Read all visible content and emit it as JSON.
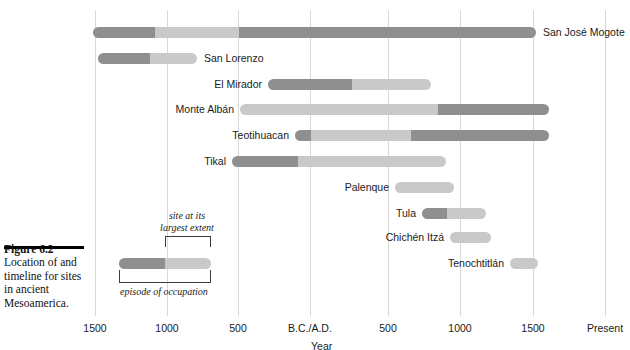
{
  "figure": {
    "title": "Figure 6.2",
    "caption": "Location of and timeline for sites in ancient Mesoamerica."
  },
  "colors": {
    "occupation": "#8f8f8f",
    "largest_extent": "#c9c9c9",
    "gridline": "#d9d9d9",
    "text": "#1a1a1a"
  },
  "axis": {
    "title": "Year",
    "ticks": [
      {
        "label": "1500",
        "x": 95
      },
      {
        "label": "1000",
        "x": 167
      },
      {
        "label": "500",
        "x": 238
      },
      {
        "label": "B.C./A.D.",
        "x": 310
      },
      {
        "label": "500",
        "x": 388
      },
      {
        "label": "1000",
        "x": 460
      },
      {
        "label": "1500",
        "x": 533
      },
      {
        "label": "Present",
        "x": 605
      }
    ]
  },
  "legend": {
    "top_label_line1": "site at its",
    "top_label_line2": "largest extent",
    "bottom_label": "episode of occupation"
  },
  "chart_data": {
    "type": "bar",
    "title": "Figure 6.2",
    "xlabel": "Year",
    "ylabel": "",
    "legend_position": "inline-left",
    "grid": true,
    "orientation": "horizontal-timeline",
    "axis_ticks": [
      "1500 B.C.",
      "1000 B.C.",
      "500 B.C.",
      "B.C./A.D.",
      "A.D. 500",
      "A.D. 1000",
      "A.D. 1500",
      "Present"
    ],
    "series": [
      {
        "name": "episode of occupation",
        "color": "#8f8f8f"
      },
      {
        "name": "site at its largest extent",
        "color": "#c9c9c9"
      }
    ],
    "categories": [
      "San José Mogote",
      "San Lorenzo",
      "El Mirador",
      "Monte Albán",
      "Teotihuacan",
      "Tikal",
      "Palenque",
      "Tula",
      "Chichén Itzá",
      "Tenochtitlán"
    ],
    "bars": [
      {
        "label": "San José Mogote",
        "label_side": "right",
        "row_y": 27,
        "x_start": 93,
        "x_end": 536,
        "segments": [
          {
            "type": "occupation",
            "x_start": 93,
            "x_end": 155
          },
          {
            "type": "largest_extent",
            "x_start": 155,
            "x_end": 239
          },
          {
            "type": "occupation",
            "x_start": 239,
            "x_end": 536
          }
        ]
      },
      {
        "label": "San Lorenzo",
        "label_side": "right",
        "row_y": 53,
        "x_start": 98,
        "x_end": 197,
        "segments": [
          {
            "type": "occupation",
            "x_start": 98,
            "x_end": 150
          },
          {
            "type": "largest_extent",
            "x_start": 150,
            "x_end": 197
          }
        ]
      },
      {
        "label": "El Mirador",
        "label_side": "left",
        "row_y": 79,
        "x_start": 268,
        "x_end": 431,
        "segments": [
          {
            "type": "occupation",
            "x_start": 268,
            "x_end": 352
          },
          {
            "type": "largest_extent",
            "x_start": 352,
            "x_end": 431
          }
        ]
      },
      {
        "label": "Monte Albán",
        "label_side": "left",
        "row_y": 104,
        "x_start": 240,
        "x_end": 549,
        "segments": [
          {
            "type": "largest_extent",
            "x_start": 240,
            "x_end": 438
          },
          {
            "type": "occupation",
            "x_start": 438,
            "x_end": 549
          }
        ]
      },
      {
        "label": "Teotihuacan",
        "label_side": "left",
        "row_y": 130,
        "x_start": 295,
        "x_end": 549,
        "segments": [
          {
            "type": "occupation",
            "x_start": 295,
            "x_end": 311
          },
          {
            "type": "largest_extent",
            "x_start": 311,
            "x_end": 411
          },
          {
            "type": "occupation",
            "x_start": 411,
            "x_end": 549
          }
        ]
      },
      {
        "label": "Tikal",
        "label_side": "left",
        "row_y": 156,
        "x_start": 232,
        "x_end": 446,
        "segments": [
          {
            "type": "occupation",
            "x_start": 232,
            "x_end": 298
          },
          {
            "type": "largest_extent",
            "x_start": 298,
            "x_end": 446
          }
        ]
      },
      {
        "label": "Palenque",
        "label_side": "left",
        "row_y": 182,
        "x_start": 395,
        "x_end": 454,
        "segments": [
          {
            "type": "largest_extent",
            "x_start": 395,
            "x_end": 454
          }
        ]
      },
      {
        "label": "Tula",
        "label_side": "left",
        "row_y": 208,
        "x_start": 422,
        "x_end": 486,
        "segments": [
          {
            "type": "occupation",
            "x_start": 422,
            "x_end": 447
          },
          {
            "type": "largest_extent",
            "x_start": 447,
            "x_end": 486
          }
        ]
      },
      {
        "label": "Chichén Itzá",
        "label_side": "left",
        "row_y": 232,
        "x_start": 450,
        "x_end": 491,
        "segments": [
          {
            "type": "largest_extent",
            "x_start": 450,
            "x_end": 491
          }
        ]
      },
      {
        "label": "Tenochtitlán",
        "label_side": "left",
        "row_y": 258,
        "x_start": 510,
        "x_end": 538,
        "segments": [
          {
            "type": "largest_extent",
            "x_start": 510,
            "x_end": 538
          }
        ]
      }
    ],
    "key_bar": {
      "x_start": 119,
      "x_end": 211,
      "row_y": 258,
      "segments": [
        {
          "type": "occupation",
          "x_start": 119,
          "x_end": 165
        },
        {
          "type": "largest_extent",
          "x_start": 165,
          "x_end": 211
        }
      ]
    }
  }
}
